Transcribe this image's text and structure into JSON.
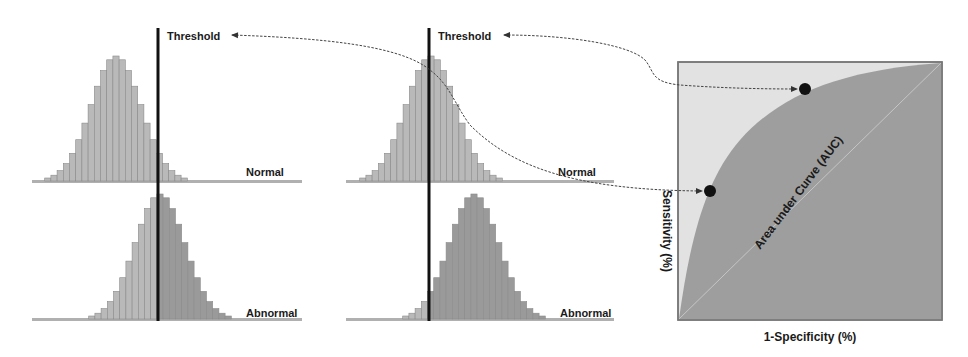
{
  "colors": {
    "background": "#ffffff",
    "bar_fill_normal": "#b9b9b9",
    "bar_fill_abnormal": "#9a9a9a",
    "bar_stroke": "#8a8a8a",
    "baseline": "#b0b0b0",
    "threshold_line": "#111111",
    "roc_background": "#e2e2e2",
    "roc_auc_fill": "#9e9e9e",
    "roc_border": "#777777",
    "dot": "#111111",
    "arrow": "#444444",
    "text": "#1a1a1a"
  },
  "panels": [
    {
      "id": "left",
      "threshold_label": "Threshold",
      "threshold_x": 158,
      "normal": {
        "label": "Normal",
        "baseline_y": 181,
        "x_start": 32,
        "x_end": 302,
        "center_x": 116,
        "peak_height": 125,
        "bars": 25
      },
      "abnormal": {
        "label": "Abnormal",
        "baseline_y": 319,
        "x_start": 32,
        "x_end": 302,
        "center_x": 160,
        "peak_height": 125,
        "bars": 25
      }
    },
    {
      "id": "middle",
      "threshold_label": "Threshold",
      "threshold_x": 429,
      "normal": {
        "label": "Normal",
        "baseline_y": 181,
        "x_start": 346,
        "x_end": 614,
        "center_x": 431,
        "peak_height": 125,
        "bars": 25
      },
      "abnormal": {
        "label": "Abnormal",
        "baseline_y": 319,
        "x_start": 346,
        "x_end": 614,
        "center_x": 474,
        "peak_height": 125,
        "bars": 25
      }
    }
  ],
  "roc": {
    "x_label": "1-Specificity (%)",
    "y_label": "Sensitivity (%)",
    "area_label": "Area under Curve (AUC)",
    "box": {
      "x": 678,
      "y": 62,
      "w": 264,
      "h": 258
    },
    "points": [
      {
        "name": "high-threshold-point",
        "x": 805,
        "y": 88
      },
      {
        "name": "low-threshold-point",
        "x": 710,
        "y": 190
      }
    ]
  }
}
